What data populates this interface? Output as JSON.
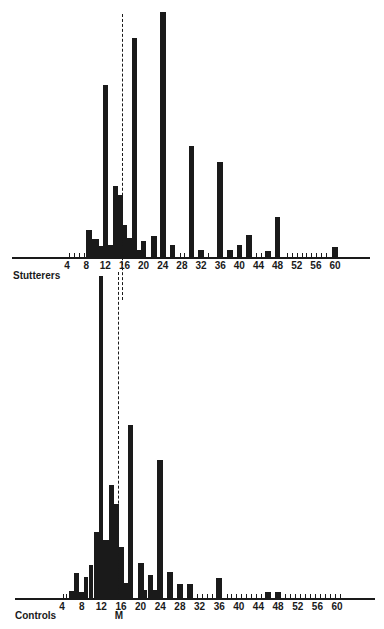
{
  "chart_data": [
    {
      "type": "bar",
      "title": "Stutterers",
      "xlabel": "",
      "ylabel": "",
      "x_ticks": [
        4,
        8,
        12,
        16,
        20,
        24,
        28,
        32,
        36,
        40,
        44,
        48,
        52,
        56,
        60
      ],
      "xlim": [
        0,
        66
      ],
      "mean_line": 15.4,
      "bins": [
        {
          "from": 8,
          "to": 9.3,
          "value": 27
        },
        {
          "from": 9.3,
          "to": 10.6,
          "value": 18
        },
        {
          "from": 10.6,
          "to": 11.6,
          "value": 11
        },
        {
          "from": 11.6,
          "to": 12.6,
          "value": 172
        },
        {
          "from": 12.6,
          "to": 13.6,
          "value": 12
        },
        {
          "from": 13.6,
          "to": 14.6,
          "value": 71
        },
        {
          "from": 14.6,
          "to": 15.6,
          "value": 62
        },
        {
          "from": 15.6,
          "to": 16.6,
          "value": 32
        },
        {
          "from": 16.6,
          "to": 17.6,
          "value": 19
        },
        {
          "from": 17.6,
          "to": 18.6,
          "value": 219
        },
        {
          "from": 18.6,
          "to": 19.4,
          "value": 7
        },
        {
          "from": 19.4,
          "to": 20.6,
          "value": 16
        },
        {
          "from": 21.6,
          "to": 22.8,
          "value": 21
        },
        {
          "from": 23.4,
          "to": 24.6,
          "value": 245
        },
        {
          "from": 25.4,
          "to": 26.6,
          "value": 12
        },
        {
          "from": 29.4,
          "to": 30.6,
          "value": 111
        },
        {
          "from": 31.4,
          "to": 32.6,
          "value": 7
        },
        {
          "from": 35.4,
          "to": 36.6,
          "value": 95
        },
        {
          "from": 37.4,
          "to": 38.6,
          "value": 7
        },
        {
          "from": 39.4,
          "to": 40.6,
          "value": 12
        },
        {
          "from": 41.4,
          "to": 42.6,
          "value": 22
        },
        {
          "from": 45.4,
          "to": 46.6,
          "value": 6
        },
        {
          "from": 47.4,
          "to": 48.6,
          "value": 40
        },
        {
          "from": 59.4,
          "to": 60.6,
          "value": 10
        }
      ],
      "zero_ticks": [
        4.5,
        5.5,
        6.5,
        7.5,
        27.5,
        28.5,
        33.5,
        43.5,
        44.5,
        50,
        51,
        52,
        53,
        54,
        55,
        56,
        57,
        58
      ]
    },
    {
      "type": "bar",
      "title": "Controls",
      "xlabel": "",
      "ylabel": "",
      "x_ticks": [
        4,
        8,
        12,
        16,
        20,
        24,
        28,
        32,
        36,
        40,
        44,
        48,
        52,
        56,
        60
      ],
      "xlim": [
        0,
        66
      ],
      "mean_line": 15.4,
      "mean_label": "M",
      "bins": [
        {
          "from": 5.5,
          "to": 6.4,
          "value": 7
        },
        {
          "from": 6.4,
          "to": 7.4,
          "value": 25
        },
        {
          "from": 7.4,
          "to": 8.4,
          "value": 6
        },
        {
          "from": 8.4,
          "to": 9.4,
          "value": 21
        },
        {
          "from": 9.4,
          "to": 10.4,
          "value": 33
        },
        {
          "from": 10.4,
          "to": 11.6,
          "value": 66
        },
        {
          "from": 11.6,
          "to": 12.4,
          "value": 322
        },
        {
          "from": 12.4,
          "to": 13.6,
          "value": 58
        },
        {
          "from": 13.6,
          "to": 14.6,
          "value": 113
        },
        {
          "from": 14.6,
          "to": 15.6,
          "value": 94
        },
        {
          "from": 15.6,
          "to": 16.6,
          "value": 51
        },
        {
          "from": 16.6,
          "to": 17.4,
          "value": 15
        },
        {
          "from": 17.4,
          "to": 18.4,
          "value": 173
        },
        {
          "from": 19.4,
          "to": 20.6,
          "value": 35
        },
        {
          "from": 20.6,
          "to": 21.4,
          "value": 8
        },
        {
          "from": 21.4,
          "to": 22.6,
          "value": 23
        },
        {
          "from": 22.6,
          "to": 23.4,
          "value": 8
        },
        {
          "from": 23.4,
          "to": 24.6,
          "value": 138
        },
        {
          "from": 25.4,
          "to": 26.6,
          "value": 26
        },
        {
          "from": 27.4,
          "to": 28.6,
          "value": 14
        },
        {
          "from": 29.4,
          "to": 30.6,
          "value": 14
        },
        {
          "from": 35.4,
          "to": 36.6,
          "value": 20
        },
        {
          "from": 45.4,
          "to": 46.6,
          "value": 6
        },
        {
          "from": 47.4,
          "to": 48.6,
          "value": 6
        }
      ],
      "zero_ticks": [
        4.2,
        4.8,
        31.5,
        32.5,
        33.5,
        34.5,
        37.5,
        38.5,
        39.5,
        40.5,
        41.5,
        42.5,
        43.5,
        44.5,
        49.5,
        50.5,
        51.5,
        52.5,
        53.5,
        54.5,
        55.5,
        56.5,
        57.5,
        58.5,
        59.5,
        60.5
      ]
    }
  ],
  "layout": [
    {
      "baseline_y": 257,
      "x0": 47.9,
      "scale": 4.786,
      "axis_left": 12,
      "axis_right": 370,
      "mean_top": 14,
      "mean_bottom": 300,
      "label_x": 13,
      "label_y": 270
    },
    {
      "baseline_y": 598,
      "x0": 42.4,
      "scale": 4.91,
      "axis_left": 15,
      "axis_right": 375,
      "mean_top": 272,
      "mean_bottom": 598,
      "label_x": 15,
      "label_y": 610,
      "mlabel_y": 610
    }
  ]
}
